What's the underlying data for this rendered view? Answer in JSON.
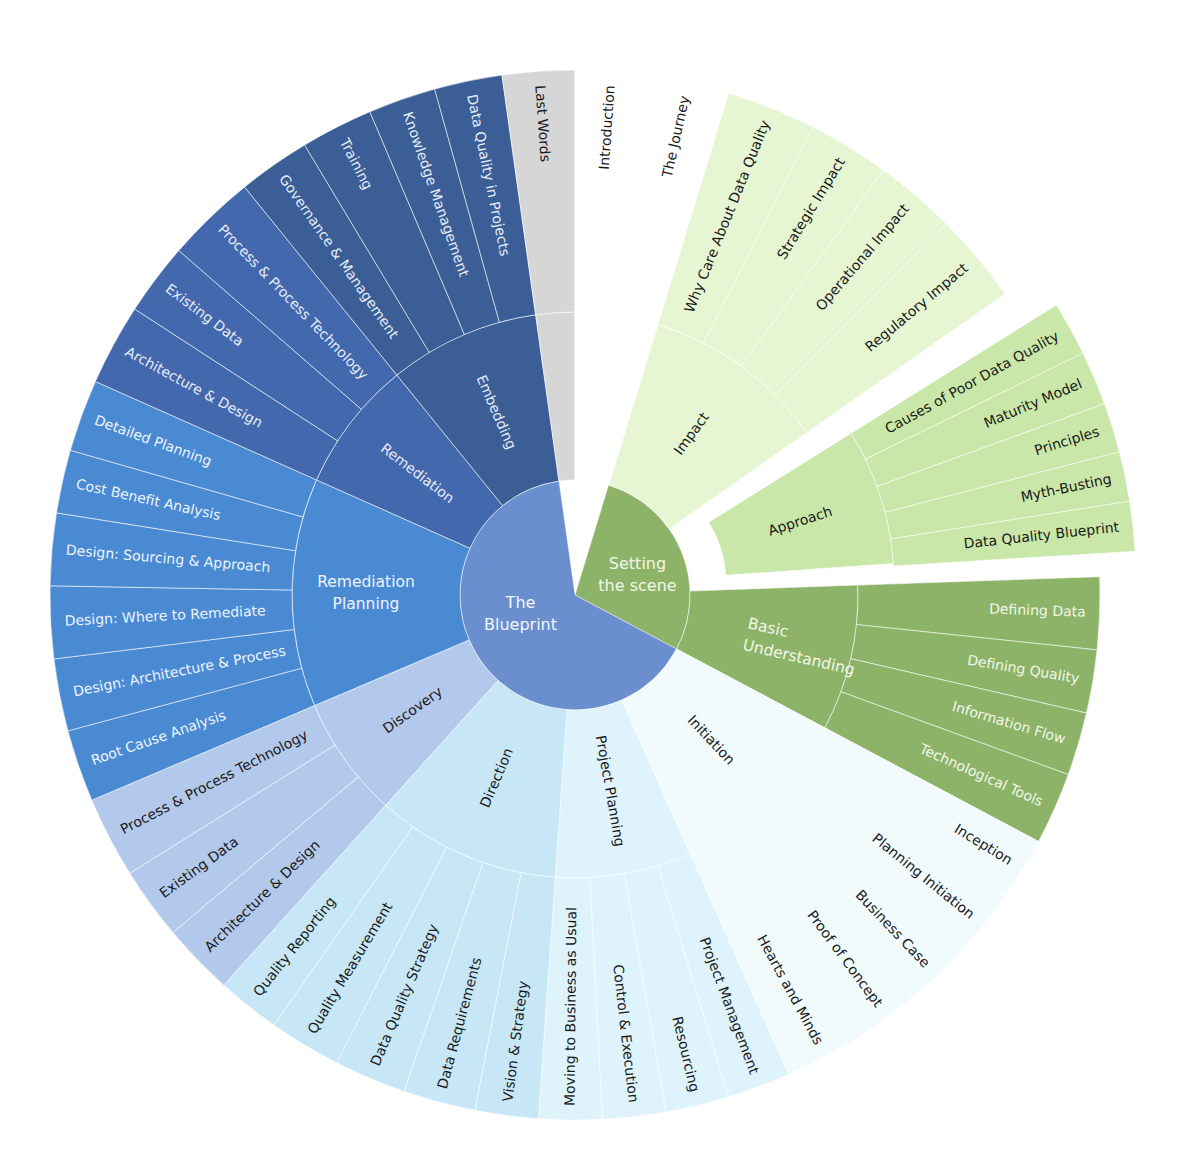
{
  "chart_data": {
    "type": "sunburst",
    "title": "",
    "center": [
      575,
      595
    ],
    "radii": {
      "core": 115,
      "middle": 283,
      "outer": 525
    },
    "roots": [
      {
        "label": "Setting the scene",
        "color": "#8db368",
        "text_color": "#f2f7e8",
        "start": 17,
        "end": 118,
        "children": [
          {
            "label": "Impact",
            "color": "#e6f6d3",
            "text_color": "#1a1a1a",
            "start": 17,
            "end": 55,
            "children": [
              {
                "label": "Why Care About Data Quality",
                "start": 17,
                "end": 27
              },
              {
                "label": "Strategic Impact",
                "start": 27,
                "end": 36
              },
              {
                "label": "Operational Impact",
                "start": 36,
                "end": 45
              },
              {
                "label": "Regulatory Impact",
                "start": 45,
                "end": 55
              }
            ]
          },
          {
            "label": "Approach",
            "color": "#c9e7a8",
            "text_color": "#1a1a1a",
            "start": 58,
            "end": 86,
            "explode": 38,
            "children": [
              {
                "label": "Causes of Poor Data Quality",
                "start": 58,
                "end": 64
              },
              {
                "label": "Maturity Model",
                "start": 64,
                "end": 70
              },
              {
                "label": "Principles",
                "start": 70,
                "end": 75.5
              },
              {
                "label": "Myth-Busting",
                "start": 75.5,
                "end": 81
              },
              {
                "label": "Data Quality Blueprint",
                "start": 81,
                "end": 86.5
              }
            ]
          },
          {
            "label": "Basic Understanding",
            "color": "#8db368",
            "text_color": "#f2f7e8",
            "start": 88,
            "end": 118,
            "children": [
              {
                "label": "Defining Data",
                "start": 88,
                "end": 96
              },
              {
                "label": "Defining Quality",
                "start": 96,
                "end": 103
              },
              {
                "label": "Information Flow",
                "start": 103,
                "end": 110
              },
              {
                "label": "Technological Tools",
                "start": 110,
                "end": 118
              }
            ]
          }
        ]
      },
      {
        "label": "The Blueprint",
        "color": "#6b8fce",
        "text_color": "#f2f6fc",
        "start": 118,
        "end": 352,
        "children": [
          {
            "label": "Initiation",
            "color": "#f1fafd",
            "text_color": "#1a1a1a",
            "start": 118,
            "end": 156,
            "children": [
              {
                "label": "Inception",
                "start": 118,
                "end": 125
              },
              {
                "label": "Planning Initiation",
                "start": 125,
                "end": 133
              },
              {
                "label": "Business Case",
                "start": 133,
                "end": 140
              },
              {
                "label": "Proof of Concept",
                "start": 140,
                "end": 147
              },
              {
                "label": "Hearts and Minds",
                "start": 147,
                "end": 156
              }
            ]
          },
          {
            "label": "Project Planning",
            "color": "#def3fb",
            "text_color": "#1a1a1a",
            "start": 156,
            "end": 184,
            "children": [
              {
                "label": "Project Management",
                "start": 156,
                "end": 163
              },
              {
                "label": "Resourcing",
                "start": 163,
                "end": 170
              },
              {
                "label": "Control & Execution",
                "start": 170,
                "end": 177
              },
              {
                "label": "Moving to Business as Usual",
                "start": 177,
                "end": 184
              }
            ]
          },
          {
            "label": "Direction",
            "color": "#c7e7f7",
            "text_color": "#1a1a1a",
            "start": 184,
            "end": 222,
            "children": [
              {
                "label": "Vision & Strategy",
                "start": 184,
                "end": 191
              },
              {
                "label": "Data Requirements",
                "start": 191,
                "end": 199
              },
              {
                "label": "Data Quality Strategy",
                "start": 199,
                "end": 207
              },
              {
                "label": "Quality Measurement",
                "start": 207,
                "end": 215
              },
              {
                "label": "Quality Reporting",
                "start": 215,
                "end": 222
              }
            ]
          },
          {
            "label": "Discovery",
            "color": "#b3c9eb",
            "text_color": "#1a1a1a",
            "start": 222,
            "end": 247,
            "children": [
              {
                "label": "Architecture & Design",
                "start": 222,
                "end": 230
              },
              {
                "label": "Existing Data",
                "start": 230,
                "end": 238
              },
              {
                "label": "Process & Process Technology",
                "start": 238,
                "end": 247
              }
            ]
          },
          {
            "label": "Remediation Planning",
            "color": "#4a8ad3",
            "text_color": "#eef4fc",
            "start": 247,
            "end": 294,
            "children": [
              {
                "label": "Root Cause Analysis",
                "start": 247,
                "end": 255
              },
              {
                "label": "Design: Architecture & Process",
                "start": 255,
                "end": 263
              },
              {
                "label": "Design: Where to Remediate",
                "start": 263,
                "end": 271
              },
              {
                "label": "Design: Sourcing & Approach",
                "start": 271,
                "end": 279
              },
              {
                "label": "Cost Benefit Analysis",
                "start": 279,
                "end": 286
              },
              {
                "label": "Detailed Planning",
                "start": 286,
                "end": 294
              }
            ]
          },
          {
            "label": "Remediation",
            "color": "#4468ad",
            "text_color": "#e6edf8",
            "start": 294,
            "end": 321,
            "children": [
              {
                "label": "Architecture & Design",
                "start": 294,
                "end": 303
              },
              {
                "label": "Existing Data",
                "start": 303,
                "end": 311
              },
              {
                "label": "Process & Process Technology",
                "start": 311,
                "end": 321
              }
            ]
          },
          {
            "label": "Embedding",
            "color": "#3a5e95",
            "text_color": "#e6edf8",
            "start": 321,
            "end": 352,
            "children": [
              {
                "label": "Governance & Management",
                "start": 321,
                "end": 329
              },
              {
                "label": "Training",
                "start": 329,
                "end": 337
              },
              {
                "label": "Knowledge Management",
                "start": 337,
                "end": 344.5
              },
              {
                "label": "Data Quality in Projects",
                "start": 344.5,
                "end": 352
              }
            ]
          }
        ]
      },
      {
        "label": "",
        "color": "#d6d6d6",
        "text_color": "#1a1a1a",
        "start": 352,
        "end": 360,
        "children": [
          {
            "label": "",
            "color": "#d6d6d6",
            "text_color": "#1a1a1a",
            "start": 352,
            "end": 360,
            "children": [
              {
                "label": "Last Words",
                "start": 352,
                "end": 360
              }
            ]
          }
        ]
      },
      {
        "label": "",
        "color": "#ffffff",
        "text_color": "#1a1a1a",
        "start": 0,
        "end": 17,
        "children": [
          {
            "label": "",
            "color": "#ffffff",
            "text_color": "#1a1a1a",
            "start": 0,
            "end": 17,
            "children": [
              {
                "label": "Introduction",
                "start": 0,
                "end": 8
              },
              {
                "label": "The Journey",
                "start": 8,
                "end": 17
              }
            ]
          }
        ]
      }
    ],
    "core_labels": [
      {
        "label": "The Blueprint",
        "lines": [
          "The",
          "Blueprint"
        ]
      },
      {
        "label": "Setting the scene",
        "lines": [
          "Setting",
          "the scene"
        ]
      }
    ]
  }
}
